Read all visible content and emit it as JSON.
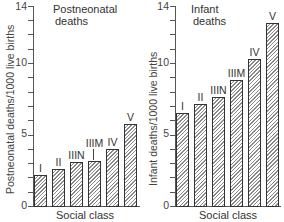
{
  "chart_data": [
    {
      "type": "bar",
      "title": "Postneonatal deaths",
      "xlabel": "Social class",
      "ylabel": "Postneonatal deaths/1000 live births",
      "categories": [
        "I",
        "II",
        "IIIN",
        "IIIM",
        "IV",
        "V"
      ],
      "values": [
        2.2,
        2.6,
        3.1,
        3.15,
        4.0,
        5.7
      ],
      "ylim": [
        0,
        14
      ],
      "yticks_labeled": [
        0,
        5,
        10,
        14
      ],
      "yticks_minor_step": 1,
      "grid": false,
      "pattern": "diagonal-hatch"
    },
    {
      "type": "bar",
      "title": "Infant deaths",
      "xlabel": "Social class",
      "ylabel": "Infant deaths/1000 live births",
      "categories": [
        "I",
        "II",
        "IIIN",
        "IIIM",
        "IV",
        "V"
      ],
      "values": [
        6.5,
        7.1,
        7.6,
        8.8,
        10.3,
        12.8
      ],
      "ylim": [
        0,
        14
      ],
      "yticks_labeled": [
        0,
        5,
        10,
        14
      ],
      "yticks_minor_step": 1,
      "grid": false,
      "pattern": "diagonal-hatch"
    }
  ],
  "left": {
    "title_line1": "Postneonatal",
    "title_line2": "deaths",
    "ylabel": "Postneonatal deaths/1000 live births",
    "xlabel": "Social class",
    "tick_labels": [
      "0",
      "5",
      "10",
      "14"
    ],
    "bar_labels": [
      "I",
      "II",
      "IIIN",
      "IIIM",
      "IV",
      "V"
    ]
  },
  "right": {
    "title_line1": "Infant",
    "title_line2": "deaths",
    "ylabel": "Infant deaths/1000 live births",
    "xlabel": "Social class",
    "tick_labels": [
      "0",
      "5",
      "10",
      "14"
    ],
    "bar_labels": [
      "I",
      "II",
      "IIIN",
      "IIIM",
      "IV",
      "V"
    ]
  }
}
